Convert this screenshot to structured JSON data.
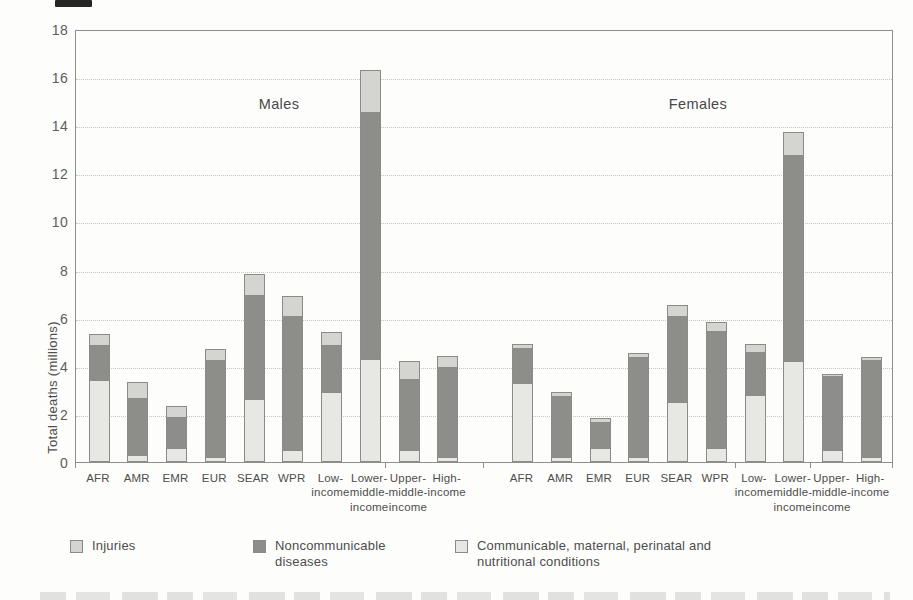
{
  "figure": {
    "y_axis_label": "Total deaths (millions)",
    "group_titles": {
      "males": "Males",
      "females": "Females"
    },
    "legend": [
      {
        "key": "injuries",
        "label": "Injuries",
        "color": "#d4d4d1"
      },
      {
        "key": "ncd",
        "label": "Noncommunicable diseases",
        "color": "#8d8d8a"
      },
      {
        "key": "comm",
        "label": "Communicable, maternal, perinatal and nutritional conditions",
        "color": "#e7e7e4"
      }
    ]
  },
  "chart_data": {
    "type": "bar",
    "stacked": true,
    "title": "",
    "xlabel": "",
    "ylabel": "Total deaths (millions)",
    "ylim": [
      0,
      18
    ],
    "ytick_step": 2,
    "yticks": [
      0,
      2,
      4,
      6,
      8,
      10,
      12,
      14,
      16,
      18
    ],
    "grid": "horizontal-dotted",
    "legend_position": "bottom",
    "stack_order_bottom_to_top": [
      "comm",
      "ncd",
      "injuries"
    ],
    "series_names": {
      "injuries": "Injuries",
      "ncd": "Noncommunicable diseases",
      "comm": "Communicable, maternal, perinatal and nutritional conditions"
    },
    "categories": [
      "AFR",
      "AMR",
      "EMR",
      "EUR",
      "SEAR",
      "WPR",
      "Low-income",
      "Lower-middle-income",
      "Upper-middle-income",
      "High-income"
    ],
    "category_label_lines": [
      [
        "AFR"
      ],
      [
        "AMR"
      ],
      [
        "EMR"
      ],
      [
        "EUR"
      ],
      [
        "SEAR"
      ],
      [
        "WPR"
      ],
      [
        "Low-",
        "income"
      ],
      [
        "Lower-",
        "middle-",
        "income"
      ],
      [
        "Upper-",
        "middle-",
        "income"
      ],
      [
        "High-",
        "income"
      ]
    ],
    "groups": [
      {
        "title": "Males",
        "series": [
          {
            "key": "comm",
            "name": "Communicable, maternal, perinatal and nutritional conditions",
            "values": [
              3.4,
              0.3,
              0.6,
              0.2,
              2.6,
              0.5,
              2.9,
              4.3,
              0.5,
              0.2
            ]
          },
          {
            "key": "ncd",
            "name": "Noncommunicable diseases",
            "values": [
              1.5,
              2.4,
              1.3,
              4.1,
              4.4,
              5.6,
              2.0,
              10.3,
              3.0,
              3.8
            ]
          },
          {
            "key": "injuries",
            "name": "Injuries",
            "values": [
              0.5,
              0.7,
              0.5,
              0.5,
              0.9,
              0.9,
              0.6,
              1.8,
              0.8,
              0.5
            ]
          }
        ],
        "totals": [
          5.4,
          3.4,
          2.4,
          4.8,
          7.9,
          7.0,
          5.5,
          16.4,
          4.3,
          4.5
        ]
      },
      {
        "title": "Females",
        "series": [
          {
            "key": "comm",
            "name": "Communicable, maternal, perinatal and nutritional conditions",
            "values": [
              3.3,
              0.2,
              0.6,
              0.2,
              2.5,
              0.6,
              2.8,
              4.2,
              0.5,
              0.2
            ]
          },
          {
            "key": "ncd",
            "name": "Noncommunicable diseases",
            "values": [
              1.5,
              2.6,
              1.1,
              4.2,
              3.6,
              4.9,
              1.8,
              8.6,
              3.1,
              4.1
            ]
          },
          {
            "key": "injuries",
            "name": "Injuries",
            "values": [
              0.2,
              0.2,
              0.2,
              0.2,
              0.5,
              0.4,
              0.4,
              1.0,
              0.15,
              0.15
            ]
          }
        ],
        "totals": [
          5.0,
          3.0,
          1.9,
          4.6,
          6.6,
          5.9,
          5.0,
          13.8,
          3.75,
          4.45
        ]
      }
    ],
    "colors": {
      "injuries": "#d4d4d1",
      "ncd": "#8d8d8a",
      "comm": "#e7e7e4"
    }
  }
}
